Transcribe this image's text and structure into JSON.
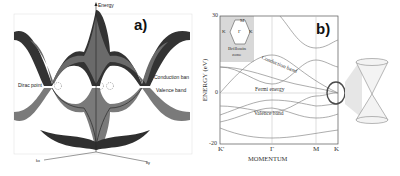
{
  "panel_a": {
    "label": "a)",
    "axis_energy": "Energy",
    "axis_kx": "kx",
    "axis_ky": "ky",
    "annotations": {
      "dirac_point": "Dirac point",
      "conduction_band": "Conduction ban",
      "valence_band": "Valence band"
    }
  },
  "panel_b": {
    "label": "b)",
    "y_axis_label": "ENERGY (eV)",
    "x_axis_label": "MOMENTUM",
    "y_ticks": [
      "30",
      "0",
      "-20"
    ],
    "x_ticks": [
      "K'",
      "Γ",
      "M",
      "K"
    ],
    "inset": {
      "points": [
        "M",
        "K",
        "K",
        "Γ"
      ],
      "caption_line1": "Brillouin",
      "caption_line2": "zone"
    },
    "annotations": {
      "conduction_band": "Conduction band",
      "fermi_energy": "Fermi energy",
      "valence_band": "Valence band"
    }
  },
  "colors": {
    "band_dark": "#2b2b2b",
    "band_mid": "#6a6a6a",
    "band_light": "#9a9a9a",
    "curve": "#8a8a8a",
    "circle": "#4a4a4a",
    "inset_bg": "#d8d8d8"
  }
}
